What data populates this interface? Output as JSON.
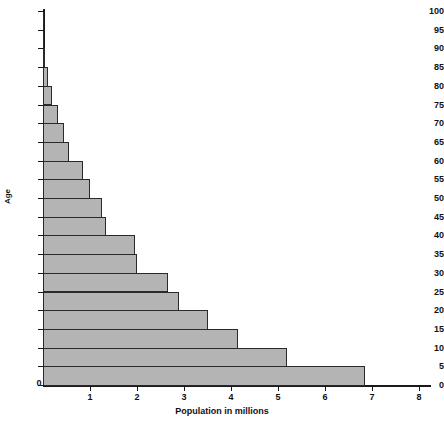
{
  "chart_data": {
    "type": "bar",
    "orientation": "horizontal",
    "title": "",
    "subtitle": "",
    "xlabel": "Population in millions",
    "ylabel": "Age",
    "xlim": [
      0,
      8.2
    ],
    "ylim": [
      0,
      100
    ],
    "grid": false,
    "legend": null,
    "bar_color": "#b4b4b4",
    "bar_edge_color": "#2a2a2a",
    "axis_color": "#1a1a1a",
    "background": "#ffffff",
    "x_ticks": [
      0,
      1,
      2,
      3,
      4,
      5,
      6,
      7,
      8
    ],
    "x_tick_labels": [
      "0",
      "1",
      "2",
      "3",
      "4",
      "5",
      "6",
      "7",
      "8"
    ],
    "y_ticks": [
      0,
      5,
      10,
      15,
      20,
      25,
      30,
      35,
      40,
      45,
      50,
      55,
      60,
      65,
      70,
      75,
      80,
      85,
      90,
      95,
      100
    ],
    "y_tick_labels": [
      "0",
      "5",
      "10",
      "15",
      "20",
      "25",
      "30",
      "35",
      "40",
      "45",
      "50",
      "55",
      "60",
      "65",
      "70",
      "75",
      "80",
      "85",
      "90",
      "95",
      "100"
    ],
    "bin_width": 5,
    "categories": [
      "0-5",
      "5-10",
      "10-15",
      "15-20",
      "20-25",
      "25-30",
      "30-35",
      "35-40",
      "40-45",
      "45-50",
      "50-55",
      "55-60",
      "60-65",
      "65-70",
      "70-75",
      "75-80",
      "80-85",
      "85-90",
      "90-95",
      "95-100"
    ],
    "bin_starts": [
      0,
      5,
      10,
      15,
      20,
      25,
      30,
      35,
      40,
      45,
      50,
      55,
      60,
      65,
      70,
      75,
      80,
      85,
      90,
      95
    ],
    "values": [
      6.85,
      5.2,
      4.15,
      3.5,
      2.9,
      2.65,
      2.0,
      1.95,
      1.35,
      1.25,
      1.0,
      0.85,
      0.55,
      0.45,
      0.32,
      0.2,
      0.1,
      0.05,
      0.03,
      0.02
    ]
  }
}
